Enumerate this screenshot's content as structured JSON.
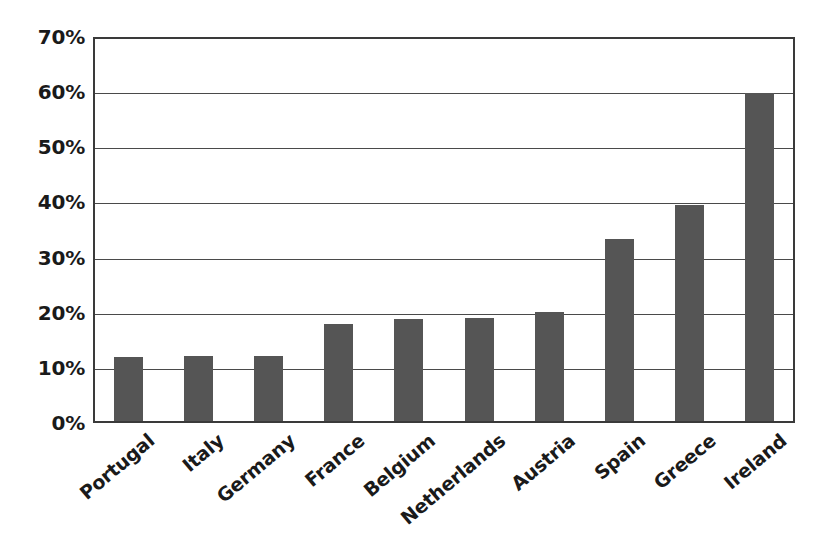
{
  "chart_data": {
    "type": "bar",
    "title": "",
    "subtitle": "",
    "xlabel": "",
    "ylabel": "",
    "categories": [
      "Portugal",
      "Italy",
      "Germany",
      "France",
      "Belgium",
      "Netherlands",
      "Austria",
      "Spain",
      "Greece",
      "Ireland"
    ],
    "values": [
      12.0,
      12.1,
      12.2,
      18.0,
      18.8,
      19.0,
      20.2,
      33.3,
      39.5,
      59.8
    ],
    "value_labels": [
      "12%",
      "12%",
      "12%",
      "18%",
      "19%",
      "19%",
      "20%",
      "33%",
      "40%",
      "60%"
    ],
    "ylim": [
      0,
      70
    ],
    "ytick_values": [
      0,
      10,
      20,
      30,
      40,
      50,
      60,
      70
    ],
    "ytick_labels": [
      "0%",
      "10%",
      "20%",
      "30%",
      "40%",
      "50%",
      "60%",
      "70%"
    ],
    "grid": true,
    "grid_axis": "y",
    "legend": false,
    "legend_position": "none",
    "series": [
      {
        "name": "",
        "values": [
          12.0,
          12.1,
          12.2,
          18.0,
          18.8,
          19.0,
          20.2,
          33.3,
          39.5,
          59.8
        ]
      }
    ],
    "colors": {
      "bar": "#555555",
      "gridline": "#4a4a4a",
      "frame": "#3a3a3a",
      "background": "#ffffff",
      "text": "#1a1a1a"
    },
    "annotations": []
  }
}
